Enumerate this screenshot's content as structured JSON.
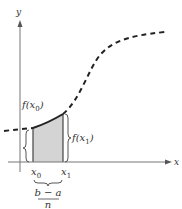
{
  "figure": {
    "type": "riemann-rectangle-diagram",
    "axes": {
      "x_label": "x",
      "y_label": "y"
    },
    "labels": {
      "f_x0": "f(x",
      "f_x0_sub": "0",
      "f_x0_close": ")",
      "f_x1": "f(x",
      "f_x1_sub": "1",
      "f_x1_close": ")",
      "x0": "x",
      "x0_sub": "0",
      "x1": "x",
      "x1_sub": "1",
      "width_num": "b − a",
      "width_den": "n"
    },
    "colors": {
      "axis": "#666666",
      "curve": "#222222",
      "shade": "#d4d4d4",
      "rect_edge": "#444444"
    }
  }
}
